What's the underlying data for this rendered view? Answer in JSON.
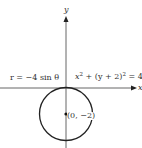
{
  "figure": {
    "axis_x_label": "x",
    "axis_y_label": "y",
    "polar_equation": "r = −4 sin θ",
    "cartesian_equation": {
      "a": "x",
      "a_exp": "2",
      "b": " + (y + 2)",
      "b_exp": "2",
      "c": " = 4"
    },
    "center_label": "(0, −2)",
    "colors": {
      "stroke": "#222222",
      "background": "#ffffff"
    }
  }
}
